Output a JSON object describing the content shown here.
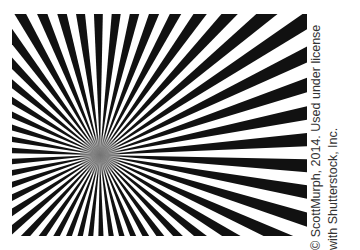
{
  "image": {
    "subject": "radial black-and-white starburst pattern",
    "ray_count": 50,
    "colors": {
      "ray": "#111111",
      "background": "#ffffff",
      "credit_text": "#333333"
    }
  },
  "credit": {
    "line1": "© ScottMurph, 2014. Used under license",
    "line2": "with Shutterstock, Inc."
  }
}
